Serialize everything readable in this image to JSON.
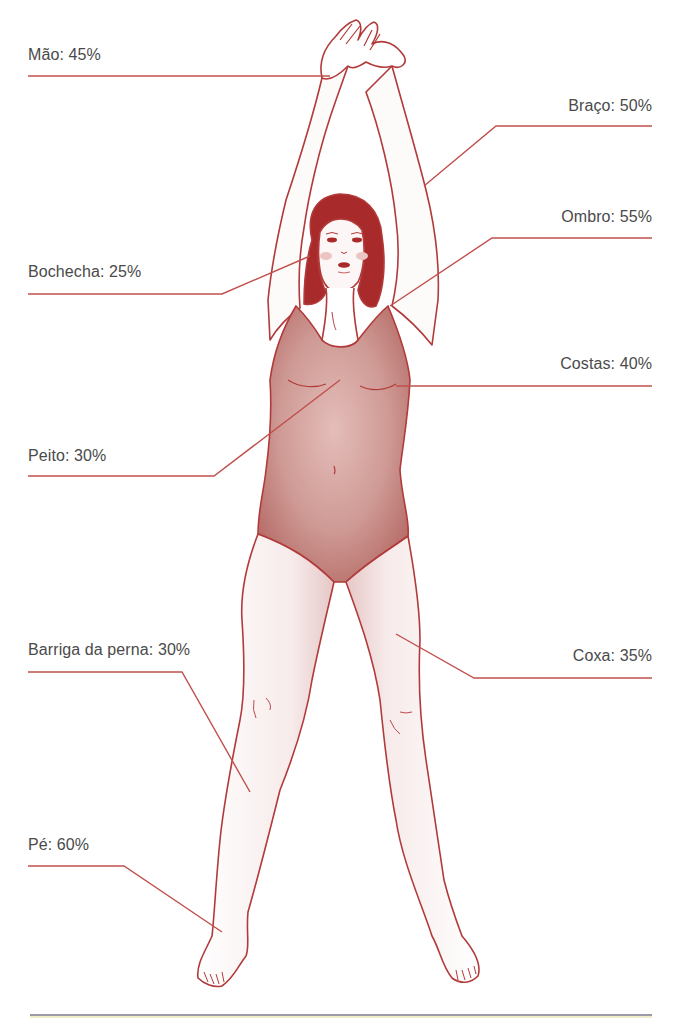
{
  "diagram": {
    "colors": {
      "line": "#b23a3a",
      "leader": "#c0504d",
      "text": "#4a4a4a",
      "swimsuit": "#c98a86",
      "hair": "#a82a2a",
      "skin_shade": "#f0dede",
      "bottom_rule": "#9a9aa8"
    },
    "labels": [
      {
        "id": "mao",
        "text": "Mão: 45%",
        "side": "left"
      },
      {
        "id": "braco",
        "text": "Braço: 50%",
        "side": "right"
      },
      {
        "id": "ombro",
        "text": "Ombro: 55%",
        "side": "right"
      },
      {
        "id": "bochecha",
        "text": "Bochecha: 25%",
        "side": "left"
      },
      {
        "id": "costas",
        "text": "Costas: 40%",
        "side": "right"
      },
      {
        "id": "peito",
        "text": "Peito: 30%",
        "side": "left"
      },
      {
        "id": "barriga",
        "text": "Barriga da perna: 30%",
        "side": "left"
      },
      {
        "id": "coxa",
        "text": "Coxa: 35%",
        "side": "right"
      },
      {
        "id": "pe",
        "text": "Pé: 60%",
        "side": "left"
      }
    ]
  }
}
